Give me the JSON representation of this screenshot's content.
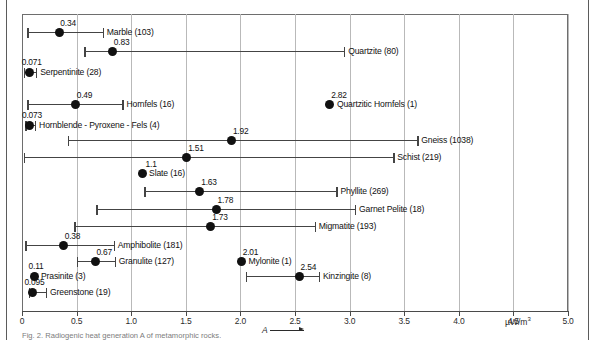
{
  "figure": {
    "caption": "Fig. 2. Radiogenic heat generation A of metamorphic rocks.",
    "unit_label": "µW/m",
    "unit_exponent": "3",
    "axis_symbol": "A"
  },
  "chart_data": {
    "type": "scatter",
    "xlabel": "A",
    "ylabel": "",
    "unit": "µW/m³",
    "xlim": [
      0,
      5.0
    ],
    "grid": true,
    "legend": "none",
    "tick_labels": [
      "0",
      "0.5",
      "1.0",
      "1.5",
      "2.0",
      "2.5",
      "3.0",
      "3.5",
      "4.0",
      "4.5",
      "5.0"
    ],
    "tick_values": [
      0,
      0.5,
      1.0,
      1.5,
      2.0,
      2.5,
      3.0,
      3.5,
      4.0,
      4.5,
      5.0
    ],
    "series_note": "Filled circle = mean value A; horizontal bar = observed range; number in parentheses = sample count",
    "points": [
      {
        "label": "Marble (103)",
        "name": "Marble",
        "n": 103,
        "mean": 0.34,
        "mean_text": "0.34",
        "min": 0.05,
        "max": 0.74,
        "y": 33
      },
      {
        "label": "Quartzite (80)",
        "name": "Quartzite",
        "n": 80,
        "mean": 0.83,
        "mean_text": "0.83",
        "min": 0.57,
        "max": 2.95,
        "y": 52
      },
      {
        "label": "Serpentinite (28)",
        "name": "Serpentinite",
        "n": 28,
        "mean": 0.071,
        "mean_text": "0.071",
        "min": 0.02,
        "max": 0.13,
        "y": 73
      },
      {
        "label": "Hornfels (16)",
        "name": "Hornfels",
        "n": 16,
        "mean": 0.49,
        "mean_text": "0.49",
        "min": 0.05,
        "max": 0.92,
        "y": 105
      },
      {
        "label": "Quartzitic Hornfels (1)",
        "name": "Quartzitic Hornfels",
        "n": 1,
        "mean": 2.82,
        "mean_text": "2.82",
        "min": null,
        "max": null,
        "y": 105
      },
      {
        "label": "Hornblende - Pyroxene - Fels (4)",
        "name": "Hornblende-Pyroxene-Fels",
        "n": 4,
        "mean": 0.073,
        "mean_text": "0.073",
        "min": 0.03,
        "max": 0.12,
        "y": 126
      },
      {
        "label": "Gneiss (1038)",
        "name": "Gneiss",
        "n": 1038,
        "mean": 1.92,
        "mean_text": "1.92",
        "min": 0.42,
        "max": 3.62,
        "y": 141
      },
      {
        "label": "Schist (219)",
        "name": "Schist",
        "n": 219,
        "mean": 1.51,
        "mean_text": "1.51",
        "min": 0.02,
        "max": 3.4,
        "y": 158
      },
      {
        "label": "Slate (16)",
        "name": "Slate",
        "n": 16,
        "mean": 1.1,
        "mean_text": "1.1",
        "min": null,
        "max": null,
        "y": 174
      },
      {
        "label": "Phyllite (269)",
        "name": "Phyllite",
        "n": 269,
        "mean": 1.63,
        "mean_text": "1.63",
        "min": 1.12,
        "max": 2.88,
        "y": 192
      },
      {
        "label": "Garnet Pelite (18)",
        "name": "Garnet Pelite",
        "n": 18,
        "mean": 1.78,
        "mean_text": "1.78",
        "min": 0.68,
        "max": 3.05,
        "y": 210
      },
      {
        "label": "Migmatite (193)",
        "name": "Migmatite",
        "n": 193,
        "mean": 1.73,
        "mean_text": "1.73",
        "min": 0.48,
        "max": 2.68,
        "y": 227
      },
      {
        "label": "Amphibolite (181)",
        "name": "Amphibolite",
        "n": 181,
        "mean": 0.38,
        "mean_text": "0.38",
        "min": 0.03,
        "max": 0.84,
        "y": 246
      },
      {
        "label": "Granulite (127)",
        "name": "Granulite",
        "n": 127,
        "mean": 0.67,
        "mean_text": "0.67",
        "min": 0.5,
        "max": 0.85,
        "y": 262
      },
      {
        "label": "Mylonite (1)",
        "name": "Mylonite",
        "n": 1,
        "mean": 2.01,
        "mean_text": "2.01",
        "min": null,
        "max": null,
        "y": 262
      },
      {
        "label": "Prasinite (3)",
        "name": "Prasinite",
        "n": 3,
        "mean": 0.11,
        "mean_text": "0.11",
        "min": null,
        "max": null,
        "y": 277
      },
      {
        "label": "Kinzingite (8)",
        "name": "Kinzingite",
        "n": 8,
        "mean": 2.54,
        "mean_text": "2.54",
        "min": 2.05,
        "max": 2.72,
        "y": 277
      },
      {
        "label": "Greenstone (19)",
        "name": "Greenstone",
        "n": 19,
        "mean": 0.095,
        "mean_text": "0.095",
        "min": 0.06,
        "max": 0.22,
        "y": 293
      }
    ]
  }
}
